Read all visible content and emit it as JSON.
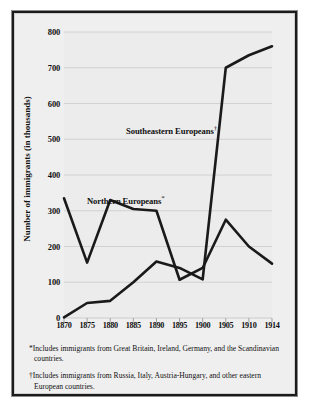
{
  "chart_data": {
    "type": "line",
    "title": "",
    "xlabel": "",
    "ylabel": "Number of  immigrants (in thousands)",
    "xlim": [
      1870,
      1914
    ],
    "ylim": [
      0,
      800
    ],
    "grid": true,
    "legend_position": "inline-annotations",
    "x": [
      1870,
      1875,
      1880,
      1885,
      1890,
      1895,
      1900,
      1905,
      1910,
      1914
    ],
    "xtick_labels": [
      "1870",
      "1875",
      "1880",
      "1885",
      "1890",
      "1895",
      "1900",
      "1905",
      "1910",
      "1914"
    ],
    "ytick_labels": [
      "0",
      "100",
      "200",
      "300",
      "400",
      "500",
      "600",
      "700",
      "800"
    ],
    "ytick_values": [
      0,
      100,
      200,
      300,
      400,
      500,
      600,
      700,
      800
    ],
    "series": [
      {
        "name": "Northern Europeans*",
        "values": [
          335,
          155,
          330,
          305,
          300,
          107,
          140,
          275,
          200,
          152
        ]
      },
      {
        "name": "Southeastern Europeans†",
        "values": [
          2,
          42,
          48,
          100,
          158,
          140,
          108,
          700,
          735,
          760
        ]
      }
    ],
    "annotations": [
      {
        "text": "Southeastern Europeans",
        "mark": "†"
      },
      {
        "text": "Northern Europeans",
        "mark": "*"
      }
    ]
  },
  "axis": {
    "y_title": "Number of  immigrants (in thousands)"
  },
  "labels": {
    "southeastern": "Southeastern Europeans",
    "southeastern_mark": "†",
    "northern": "Northern Europeans",
    "northern_mark": "*"
  },
  "footnotes": [
    {
      "mark": "*",
      "text": "Includes immigrants from Great Britain, Ireland, Germany, and the Scandinavian countries."
    },
    {
      "mark": "†",
      "text": "Includes immigrants from Russia, Italy, Austria-Hungary, and other eastern European countries."
    }
  ],
  "colors": {
    "line": "#1a1a1a",
    "plot_background": "#ececec",
    "panel_background": "#efefef",
    "grid": "#cccccc",
    "frame": "#1b1b1b",
    "text": "#111111"
  }
}
